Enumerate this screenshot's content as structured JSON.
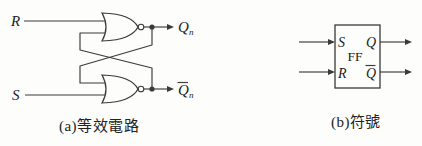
{
  "palette": {
    "background": "#fdfdfc",
    "line": "#3a3a3a",
    "label": "#222222"
  },
  "equivalent_circuit": {
    "caption": "(a)等效電路",
    "input_r": "R",
    "input_s": "S",
    "output_q": {
      "base": "Q",
      "sub": "n"
    },
    "output_qbar": {
      "base": "Q",
      "sub": "n",
      "overline": true
    },
    "gate_type": "NOR"
  },
  "symbol": {
    "caption": "(b)符號",
    "block_label": "FF",
    "pin_s": "S",
    "pin_r": "R",
    "pin_q": "Q",
    "pin_qbar": {
      "base": "Q",
      "overline": true
    }
  }
}
